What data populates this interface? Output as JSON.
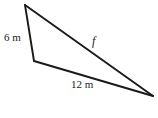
{
  "figure": {
    "kind": "triangle-diagram",
    "background_color": "#ffffff",
    "stroke_color": "#1a1a1a",
    "labels": {
      "left_side": "6 m",
      "bottom_side": "12 m",
      "hypotenuse_side": "f"
    },
    "vertices": {
      "top": "25,5",
      "bottom_left": "34,61",
      "right": "153,96"
    },
    "sides": [
      {
        "name": "left",
        "label": "6 m",
        "length_value": 6,
        "unit": "m",
        "from": "top",
        "to": "bottom_left"
      },
      {
        "name": "bottom",
        "label": "12 m",
        "length_value": 12,
        "unit": "m",
        "from": "bottom_left",
        "to": "right"
      },
      {
        "name": "hypotenuse",
        "label": "f",
        "length_value": null,
        "unit": "m",
        "from": "top",
        "to": "right"
      }
    ]
  }
}
